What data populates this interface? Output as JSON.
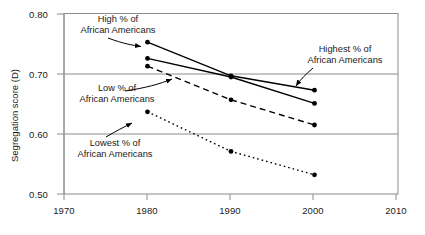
{
  "chart_data": {
    "type": "line",
    "title": "",
    "xlabel": "",
    "ylabel": "Segregation score (D)",
    "x": [
      1980,
      1990,
      2000
    ],
    "xlim": [
      1970,
      2010
    ],
    "ylim": [
      0.5,
      0.8
    ],
    "xticks": [
      "1970",
      "1980",
      "1990",
      "2000",
      "2010"
    ],
    "yticks": [
      "0.50",
      "0.60",
      "0.70",
      "0.80"
    ],
    "grid": "horizontal-gridlines-at-0.60-and-0.70",
    "legend": "inline-annotations",
    "series": [
      {
        "name": "Highest % of African Americans",
        "style": "solid",
        "values": [
          0.753,
          0.697,
          0.673
        ]
      },
      {
        "name": "High % of African Americans",
        "style": "solid",
        "values": [
          0.726,
          0.695,
          0.651
        ]
      },
      {
        "name": "Low % of African Americans",
        "style": "dashed",
        "values": [
          0.713,
          0.657,
          0.615
        ]
      },
      {
        "name": "Lowest % of African Americans",
        "style": "dotted",
        "values": [
          0.637,
          0.571,
          0.532
        ]
      }
    ],
    "annotations": [
      {
        "id": "high",
        "line1": "High % of",
        "line2": "African Americans"
      },
      {
        "id": "highest",
        "line1": "Highest % of",
        "line2": "African Americans"
      },
      {
        "id": "low",
        "line1": "Low % of",
        "line2": "African Americans"
      },
      {
        "id": "lowest",
        "line1": "Lowest % of",
        "line2": "African Americans"
      }
    ]
  },
  "axes": {
    "y_title": "Segregation score (D)",
    "y_labels": [
      "0.80",
      "0.70",
      "0.60",
      "0.50"
    ],
    "x_labels": [
      "1970",
      "1980",
      "1990",
      "2000",
      "2010"
    ]
  },
  "colors": {
    "line": "#000000",
    "frame": "#8c8c8c",
    "gridline": "#8c8c8c",
    "text": "#1a1a1a",
    "background": "#ffffff"
  }
}
